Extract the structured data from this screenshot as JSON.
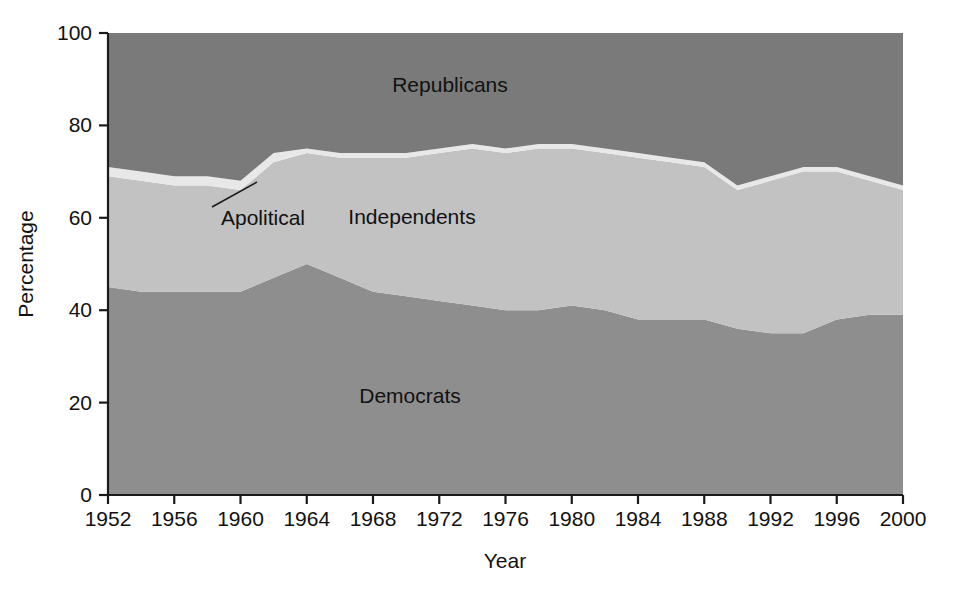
{
  "chart_data": {
    "type": "area",
    "title": "",
    "subtitle": "",
    "xlabel": "Year",
    "ylabel": "Percentage",
    "xlim": [
      1952,
      2000
    ],
    "ylim": [
      0,
      100
    ],
    "grid": false,
    "legend_position": "inline-annotations",
    "stacked": true,
    "xtick_labels": [
      "1952",
      "1956",
      "1960",
      "1964",
      "1968",
      "1972",
      "1976",
      "1980",
      "1984",
      "1988",
      "1992",
      "1996",
      "2000"
    ],
    "xticks": [
      1952,
      1956,
      1960,
      1964,
      1968,
      1972,
      1976,
      1980,
      1984,
      1988,
      1992,
      1996,
      2000
    ],
    "ytick_labels": [
      "0",
      "20",
      "40",
      "60",
      "80",
      "100"
    ],
    "yticks": [
      0,
      20,
      40,
      60,
      80,
      100
    ],
    "x": [
      1952,
      1954,
      1956,
      1958,
      1960,
      1962,
      1964,
      1966,
      1968,
      1970,
      1972,
      1974,
      1976,
      1978,
      1980,
      1982,
      1984,
      1986,
      1988,
      1990,
      1992,
      1994,
      1996,
      1998,
      2000
    ],
    "series": [
      {
        "name": "Democrats",
        "color": "#8e8e8e",
        "values": [
          45,
          44,
          44,
          44,
          44,
          47,
          50,
          47,
          44,
          43,
          42,
          41,
          40,
          40,
          41,
          40,
          38,
          38,
          38,
          36,
          35,
          35,
          38,
          39,
          39
        ]
      },
      {
        "name": "Independents",
        "color": "#c2c2c2",
        "values": [
          24,
          24,
          23,
          23,
          22,
          25,
          24,
          26,
          29,
          30,
          32,
          34,
          34,
          35,
          34,
          34,
          35,
          34,
          33,
          30,
          33,
          35,
          32,
          29,
          27
        ]
      },
      {
        "name": "Apolitical",
        "color": "#e8e8e8",
        "values": [
          2,
          2,
          2,
          2,
          2,
          2,
          1,
          1,
          1,
          1,
          1,
          1,
          1,
          1,
          1,
          1,
          1,
          1,
          1,
          1,
          1,
          1,
          1,
          1,
          1
        ]
      },
      {
        "name": "Republicans",
        "color": "#7a7a7a",
        "values": [
          29,
          30,
          31,
          31,
          32,
          26,
          25,
          26,
          26,
          26,
          25,
          24,
          25,
          24,
          24,
          25,
          26,
          27,
          28,
          33,
          31,
          29,
          29,
          31,
          33
        ]
      }
    ],
    "annotations": [
      {
        "text": "Republicans",
        "x": 1972,
        "y": 88
      },
      {
        "text": "Independents",
        "x": 1970,
        "y": 62
      },
      {
        "text": "Apolitical",
        "x": 1960,
        "y": 61
      },
      {
        "text": "Democrats",
        "x": 1972,
        "y": 22
      }
    ],
    "colors": {
      "democrats": "#8e8e8e",
      "independents": "#c2c2c2",
      "apolitical": "#e8e8e8",
      "republicans": "#7a7a7a",
      "axis": "#1a1a1a",
      "text": "#111111",
      "background": "#ffffff"
    }
  },
  "axis": {
    "ylabel": "Percentage",
    "xlabel": "Year"
  },
  "labels": {
    "republicans": "Republicans",
    "independents": "Independents",
    "apolitical": "Apolitical",
    "democrats": "Democrats"
  }
}
